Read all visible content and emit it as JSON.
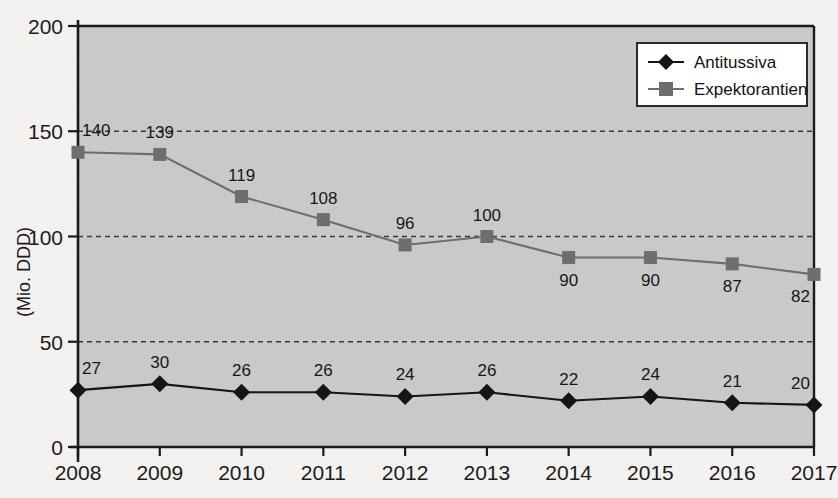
{
  "chart_data": {
    "type": "line",
    "title": "",
    "xlabel": "",
    "ylabel": "(Mio. DDD)",
    "categories": [
      "2008",
      "2009",
      "2010",
      "2011",
      "2012",
      "2013",
      "2014",
      "2015",
      "2016",
      "2017"
    ],
    "ylim": [
      0,
      200
    ],
    "yticks": [
      "0",
      "50",
      "100",
      "150",
      "200"
    ],
    "ytick_values": [
      0,
      50,
      100,
      150,
      200
    ],
    "grid": "horizontal-dashed",
    "legend_position": "top-right",
    "series": [
      {
        "name": "Antitussiva",
        "marker": "diamond",
        "color": "#151515",
        "values": [
          27,
          30,
          26,
          26,
          24,
          26,
          22,
          24,
          21,
          20
        ],
        "label_position": "above"
      },
      {
        "name": "Expektorantien",
        "marker": "square",
        "color": "#6e6e6e",
        "values": [
          140,
          139,
          119,
          108,
          96,
          100,
          90,
          90,
          87,
          82
        ],
        "label_positions": [
          "above",
          "above",
          "above",
          "above",
          "above",
          "above",
          "below",
          "below",
          "below",
          "below"
        ]
      }
    ]
  },
  "colors": {
    "plot_background": "#c9c9c9",
    "page_background": "#f6f4f2",
    "axis": "#1b1b1b",
    "grid": "#3a3a3a",
    "antitussiva": "#151515",
    "expektorantien": "#6e6e6e",
    "legend_background": "#ffffff"
  },
  "legend": {
    "items": [
      {
        "label": "Antitussiva",
        "marker": "diamond"
      },
      {
        "label": "Expektorantien",
        "marker": "square"
      }
    ]
  }
}
